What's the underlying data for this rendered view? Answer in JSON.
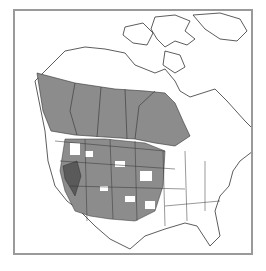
{
  "map": {
    "type": "range-map",
    "region": "North America",
    "colors": {
      "background": "#ffffff",
      "frame": "#9a9a9a",
      "range_fill": "#8c8c8c",
      "range_dark": "#5a5a5a",
      "boundary": "#333333"
    },
    "layers": [
      {
        "name": "canada-range",
        "fill": "#8c8c8c"
      },
      {
        "name": "western-us-range",
        "fill": "#8c8c8c"
      },
      {
        "name": "nevada-core",
        "fill": "#5a5a5a"
      }
    ]
  }
}
